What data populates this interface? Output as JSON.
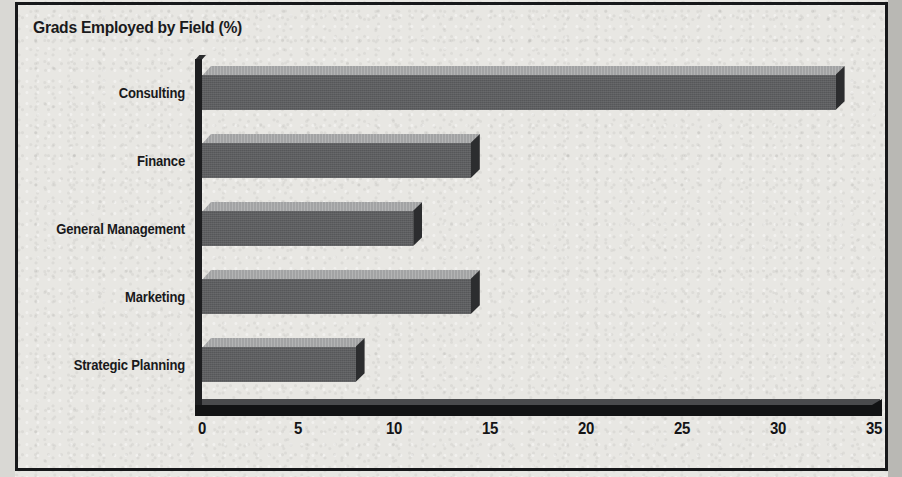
{
  "chart_data": {
    "type": "bar",
    "orientation": "horizontal",
    "title": "Grads Employed by Field (%)",
    "xlabel": "",
    "ylabel": "",
    "xlim": [
      0,
      35
    ],
    "xticks": [
      0,
      5,
      10,
      15,
      20,
      25,
      30,
      35
    ],
    "grid": false,
    "legend": false,
    "style": "3d-shaded-bars",
    "categories": [
      "Consulting",
      "Finance",
      "General Management",
      "Marketing",
      "Strategic Planning"
    ],
    "values": [
      33,
      14,
      11,
      14,
      8
    ],
    "colors": {
      "bar_front": "#5d5e60",
      "bar_top": "#a2a3a4",
      "bar_side": "#2c2d2f",
      "axis": "#121314",
      "text": "#19191b",
      "background": "#e8e7e3",
      "frame": "#17181a"
    }
  },
  "chart": {
    "title": "Grads Employed by Field (%)",
    "x_ticks": [
      {
        "label": "0",
        "value": 0
      },
      {
        "label": "5",
        "value": 5
      },
      {
        "label": "10",
        "value": 10
      },
      {
        "label": "15",
        "value": 15
      },
      {
        "label": "20",
        "value": 20
      },
      {
        "label": "25",
        "value": 25
      },
      {
        "label": "30",
        "value": 30
      },
      {
        "label": "35",
        "value": 35
      }
    ],
    "bars": [
      {
        "label": "Consulting",
        "value": 33
      },
      {
        "label": "Finance",
        "value": 14
      },
      {
        "label": "General Management",
        "value": 11
      },
      {
        "label": "Marketing",
        "value": 14
      },
      {
        "label": "Strategic Planning",
        "value": 8
      }
    ]
  }
}
